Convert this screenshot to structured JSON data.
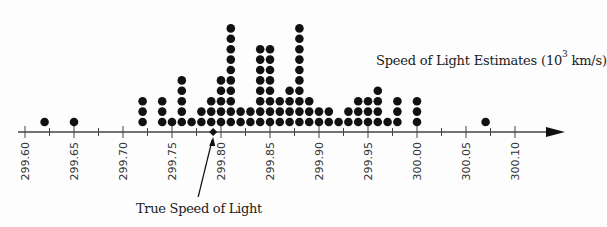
{
  "chart_data": {
    "type": "scatter",
    "subtype": "dot_plot",
    "title_parts": {
      "prefix": "Speed of Light Estimates (10",
      "exponent": "3",
      "suffix": " km/s)"
    },
    "xlabel": "Speed of Light Estimates (10^3 km/s)",
    "ylabel": "",
    "xlim": [
      299.6,
      300.1
    ],
    "x_ticks_major": [
      "299.60",
      "299.65",
      "299.70",
      "299.75",
      "299.80",
      "299.85",
      "299.90",
      "299.95",
      "300.00",
      "300.05",
      "300.10"
    ],
    "x_tick_minor_step": 0.025,
    "grid": false,
    "legend": null,
    "bin_width": 0.01,
    "x": [
      299.62,
      299.65,
      299.72,
      299.74,
      299.75,
      299.76,
      299.77,
      299.78,
      299.79,
      299.8,
      299.81,
      299.82,
      299.83,
      299.84,
      299.85,
      299.86,
      299.87,
      299.88,
      299.89,
      299.9,
      299.91,
      299.92,
      299.93,
      299.94,
      299.95,
      299.96,
      299.97,
      299.98,
      300.0,
      300.07
    ],
    "counts": [
      1,
      1,
      3,
      3,
      1,
      5,
      1,
      2,
      3,
      5,
      10,
      2,
      2,
      8,
      8,
      3,
      4,
      10,
      3,
      2,
      2,
      1,
      2,
      3,
      3,
      4,
      1,
      3,
      3,
      1
    ],
    "total_observations": 100,
    "annotations": [
      {
        "text": "True Speed of Light",
        "x": 299.792,
        "marker": "diamond",
        "arrow": true
      }
    ]
  },
  "labels": {
    "title_prefix": "Speed of Light Estimates (10",
    "title_exp": "3",
    "title_suffix": " km/s)",
    "annotation": "True Speed of Light"
  },
  "colors": {
    "dot": "#111111",
    "axis": "#444444",
    "text": "#1a1a1a"
  }
}
